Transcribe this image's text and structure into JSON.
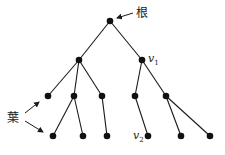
{
  "diagram": {
    "type": "rooted-tree",
    "labels": {
      "root": "根",
      "leaves": "葉",
      "v1_letter": "v",
      "v1_sub": "1",
      "v2_letter": "v",
      "v2_sub": "2"
    },
    "nodes": [
      {
        "id": "root",
        "x": 110,
        "y": 21
      },
      {
        "id": "a",
        "x": 79,
        "y": 60
      },
      {
        "id": "v1",
        "x": 142,
        "y": 60
      },
      {
        "id": "a1",
        "x": 48,
        "y": 96
      },
      {
        "id": "a2",
        "x": 74,
        "y": 96
      },
      {
        "id": "a3",
        "x": 102,
        "y": 96
      },
      {
        "id": "b1",
        "x": 135,
        "y": 96
      },
      {
        "id": "b2",
        "x": 166,
        "y": 96
      },
      {
        "id": "a2l",
        "x": 53,
        "y": 136
      },
      {
        "id": "a2r",
        "x": 83,
        "y": 136
      },
      {
        "id": "a3c",
        "x": 107,
        "y": 136
      },
      {
        "id": "v2",
        "x": 148,
        "y": 136
      },
      {
        "id": "b2l",
        "x": 181,
        "y": 136
      },
      {
        "id": "b2r",
        "x": 210,
        "y": 136
      }
    ],
    "edges": [
      [
        "root",
        "a"
      ],
      [
        "root",
        "v1"
      ],
      [
        "a",
        "a1"
      ],
      [
        "a",
        "a2"
      ],
      [
        "a",
        "a3"
      ],
      [
        "v1",
        "b1"
      ],
      [
        "v1",
        "b2"
      ],
      [
        "a2",
        "a2l"
      ],
      [
        "a2",
        "a2r"
      ],
      [
        "a3",
        "a3c"
      ],
      [
        "b1",
        "v2"
      ],
      [
        "b2",
        "b2l"
      ],
      [
        "b2",
        "b2r"
      ]
    ]
  }
}
